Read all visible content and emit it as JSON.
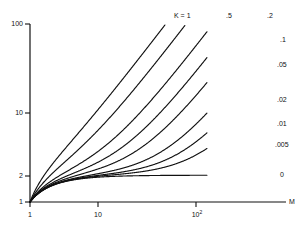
{
  "chart_data": {
    "type": "line",
    "title": "",
    "xlabel": "M",
    "ylabel": "",
    "xscale": "log",
    "yscale": "log",
    "xlim": [
      1,
      400
    ],
    "ylim": [
      1,
      100
    ],
    "grid": false,
    "legend_position": "curve-end-labels",
    "x_ticks": [
      {
        "value": 1,
        "label": "1"
      },
      {
        "value": 10,
        "label": "10"
      },
      {
        "value": 100,
        "label": "10",
        "exponent": "2"
      }
    ],
    "y_ticks": [
      {
        "value": 1,
        "label": "1"
      },
      {
        "value": 2,
        "label": "2"
      },
      {
        "value": 10,
        "label": "10"
      },
      {
        "value": 100,
        "label": "100"
      }
    ],
    "series_parameter_name": "K",
    "series": [
      {
        "name": "K = 1",
        "k": 1.0,
        "label": "K = 1",
        "label_pos": "top"
      },
      {
        "name": ".5",
        "k": 0.5,
        "label": ".5",
        "label_pos": "top"
      },
      {
        "name": ".2",
        "k": 0.2,
        "label": ".2",
        "label_pos": "top"
      },
      {
        "name": ".1",
        "k": 0.1,
        "label": ".1",
        "label_pos": "right"
      },
      {
        "name": ".05",
        "k": 0.05,
        "label": ".05",
        "label_pos": "right"
      },
      {
        "name": ".02",
        "k": 0.02,
        "label": ".02",
        "label_pos": "right"
      },
      {
        "name": ".01",
        "k": 0.01,
        "label": ".01",
        "label_pos": "right"
      },
      {
        "name": ".005",
        "k": 0.005,
        "label": ".005",
        "label_pos": "right"
      },
      {
        "name": "0",
        "k": 0.0,
        "label": "0",
        "label_pos": "right"
      }
    ],
    "curve_model": "y = 2 - 1/M + K*(M-1)",
    "colors": {
      "axis": "#111111",
      "curve": "#111111",
      "background": "#ffffff"
    }
  },
  "axis_labels": {
    "x_axis_name": "M",
    "y_top": "100",
    "y_mid": "10",
    "y_two": "2",
    "y_one": "1",
    "x_one": "1",
    "x_ten": "10",
    "x_hundred_base": "10",
    "x_hundred_exp": "2"
  },
  "curve_labels": {
    "c0": "K = 1",
    "c1": ".5",
    "c2": ".2",
    "c3": ".1",
    "c4": ".05",
    "c5": ".02",
    "c6": ".01",
    "c7": ".005",
    "c8": "0"
  }
}
